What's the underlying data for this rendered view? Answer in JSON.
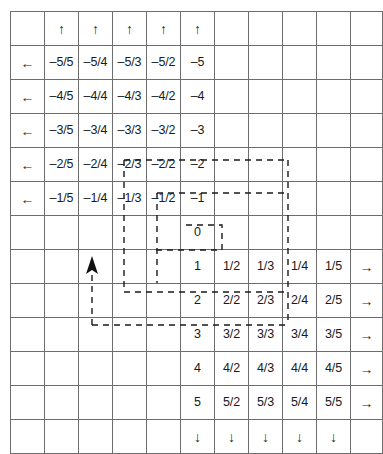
{
  "figure": {
    "grid": {
      "columns": 11,
      "rows": 13,
      "cell_size_px": 33,
      "line_color": "#6d6d6d",
      "border_color": "#5a5a5a",
      "text_color": "#1a1a1a"
    },
    "icons": {
      "up_arrow": "↑",
      "down_arrow": "↓",
      "left_arrow": "←",
      "right_arrow": "→",
      "cursor_arrow": "cursor-up-arrow"
    },
    "cells": [
      [
        "",
        "↑",
        "↑",
        "↑",
        "↑",
        "↑",
        "",
        "",
        "",
        "",
        ""
      ],
      [
        "←",
        "–5/5",
        "–5/4",
        "–5/3",
        "–5/2",
        "–5",
        "",
        "",
        "",
        "",
        ""
      ],
      [
        "←",
        "–4/5",
        "–4/4",
        "–4/3",
        "–4/2",
        "–4",
        "",
        "",
        "",
        "",
        ""
      ],
      [
        "←",
        "–3/5",
        "–3/4",
        "–3/3",
        "–3/2",
        "–3",
        "",
        "",
        "",
        "",
        ""
      ],
      [
        "←",
        "–2/5",
        "–2/4",
        "–2/3",
        "–2/2",
        "–2",
        "",
        "",
        "",
        "",
        ""
      ],
      [
        "←",
        "–1/5",
        "–1/4",
        "–1/3",
        "–1/2",
        "–1",
        "",
        "",
        "",
        "",
        ""
      ],
      [
        "",
        "",
        "",
        "",
        "",
        "0",
        "",
        "",
        "",
        "",
        ""
      ],
      [
        "",
        "",
        "",
        "",
        "",
        "1",
        "1/2",
        "1/3",
        "1/4",
        "1/5",
        "→"
      ],
      [
        "",
        "",
        "",
        "",
        "",
        "2",
        "2/2",
        "2/3",
        "2/4",
        "2/5",
        "→"
      ],
      [
        "",
        "",
        "",
        "",
        "",
        "3",
        "3/2",
        "3/3",
        "3/4",
        "3/5",
        "→"
      ],
      [
        "",
        "",
        "",
        "",
        "",
        "4",
        "4/2",
        "4/3",
        "4/4",
        "4/5",
        "→"
      ],
      [
        "",
        "",
        "",
        "",
        "",
        "5",
        "5/2",
        "5/3",
        "5/4",
        "5/5",
        "→"
      ],
      [
        "",
        "",
        "",
        "",
        "",
        "↓",
        "↓",
        "↓",
        "↓",
        "↓",
        ""
      ]
    ],
    "path": {
      "style": "dashed",
      "color": "#1a1a1a",
      "dash_pattern": "6 5",
      "stroke_width": 1.4,
      "description": "Zig-zag enumeration path sweeping outward from 0"
    }
  }
}
